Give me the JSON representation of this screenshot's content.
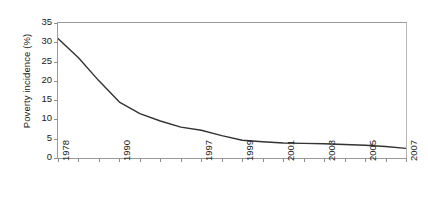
{
  "chart_data": {
    "type": "line",
    "title": "",
    "subtitle": "",
    "xlabel": "",
    "ylabel": "Poverty incidence (%)",
    "ylim": [
      0,
      35
    ],
    "yticks": [
      0,
      5,
      10,
      15,
      20,
      25,
      30,
      35
    ],
    "ytick_labels": [
      "0",
      "5",
      "10",
      "15",
      "20",
      "25",
      "30",
      "35"
    ],
    "grid": false,
    "legend": "none",
    "line_color": "#333333",
    "axis_color": "#8e8e8e",
    "x": [
      "1978",
      "1980",
      "1985",
      "1990",
      "1992",
      "1994",
      "1996",
      "1997",
      "1998",
      "1999",
      "2000",
      "2001",
      "2002",
      "2003",
      "2004",
      "2005",
      "2006",
      "2007"
    ],
    "xtick_labels": [
      "1978",
      "1990",
      "1997",
      "1999",
      "2001",
      "2003",
      "2005",
      "2007"
    ],
    "xtick_label_positions": [
      0,
      3,
      7,
      9,
      11,
      13,
      15,
      17
    ],
    "minor_tick_count": 18,
    "series": [
      {
        "name": "Poverty incidence",
        "values": [
          31.0,
          26.0,
          20.0,
          14.5,
          11.5,
          9.6,
          8.0,
          7.2,
          5.8,
          4.6,
          4.2,
          3.9,
          3.8,
          3.7,
          3.5,
          3.3,
          3.0,
          2.5
        ]
      }
    ]
  }
}
